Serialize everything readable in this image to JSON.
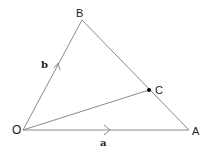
{
  "diagram": {
    "type": "vector-triangle",
    "points": {
      "O": {
        "label": "O",
        "x": 23,
        "y": 130
      },
      "A": {
        "label": "A",
        "x": 189,
        "y": 130
      },
      "B": {
        "label": "B",
        "x": 82,
        "y": 20
      },
      "C": {
        "label": "C",
        "x": 149,
        "y": 90
      }
    },
    "segments": [
      {
        "from": "O",
        "to": "A"
      },
      {
        "from": "O",
        "to": "B"
      },
      {
        "from": "A",
        "to": "B"
      },
      {
        "from": "O",
        "to": "C"
      }
    ],
    "vectors": {
      "a": {
        "label": "a",
        "along": "OA"
      },
      "b": {
        "label": "b",
        "along": "OB"
      }
    },
    "colors": {
      "line": "#8a8a8a",
      "text": "#222222",
      "dot": "#000000"
    }
  }
}
